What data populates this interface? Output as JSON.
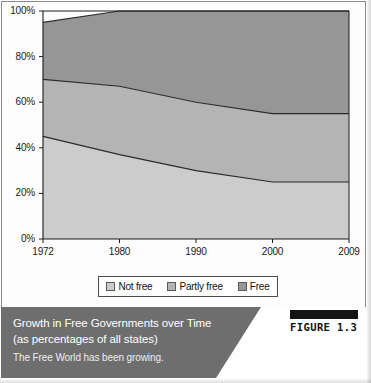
{
  "figure": {
    "number_label": "FIGURE 1.3",
    "caption_title_line_1": "Growth in Free Governments over Time",
    "caption_title_line_2": "(as percentages of all states)",
    "caption_subtitle": "The Free World has been growing."
  },
  "legend": {
    "entries": [
      {
        "label": "Not free",
        "color": "#cccccc"
      },
      {
        "label": "Partly free",
        "color": "#b4b4b4"
      },
      {
        "label": "Free",
        "color": "#969696"
      }
    ]
  },
  "colors": {
    "not_free": "#cccccc",
    "partly_free": "#b4b4b4",
    "free": "#969696",
    "axis": "#1a1a1a",
    "series_outline": "#2b2b2b",
    "caption_band": "#6e6e6e",
    "figure_bar": "#141414"
  },
  "chart_data": {
    "type": "area",
    "stacked": true,
    "title": "Growth in Free Governments over Time (as percentages of all states)",
    "xlabel": "",
    "ylabel": "",
    "x": [
      1972,
      1980,
      1990,
      2000,
      2009
    ],
    "categories": [
      "1972",
      "1980",
      "1990",
      "2000",
      "2009"
    ],
    "xtick_labels": [
      "1972",
      "1980",
      "1990",
      "2000",
      "2009"
    ],
    "ytick_labels": [
      "0%",
      "20%",
      "40%",
      "60%",
      "80%",
      "100%"
    ],
    "ytick_values": [
      0,
      20,
      40,
      60,
      80,
      100
    ],
    "ylim": [
      0,
      100
    ],
    "grid": false,
    "legend_position": "bottom",
    "series": [
      {
        "name": "Not free",
        "color": "#cccccc",
        "values": [
          45,
          37,
          30,
          25,
          25
        ]
      },
      {
        "name": "Partly free",
        "color": "#b4b4b4",
        "values": [
          25,
          30,
          30,
          30,
          30
        ]
      },
      {
        "name": "Free",
        "color": "#969696",
        "values": [
          25,
          33,
          40,
          45,
          45
        ]
      }
    ],
    "cumulative_upper_bounds": [
      {
        "name": "Not free",
        "values": [
          45,
          37,
          30,
          25,
          25
        ]
      },
      {
        "name": "Partly free",
        "values": [
          70,
          67,
          60,
          55,
          55
        ]
      },
      {
        "name": "Free",
        "values": [
          95,
          100,
          100,
          100,
          100
        ]
      }
    ]
  },
  "plot_geometry": {
    "left": 43,
    "right": 349,
    "top": 11,
    "bottom": 239
  }
}
